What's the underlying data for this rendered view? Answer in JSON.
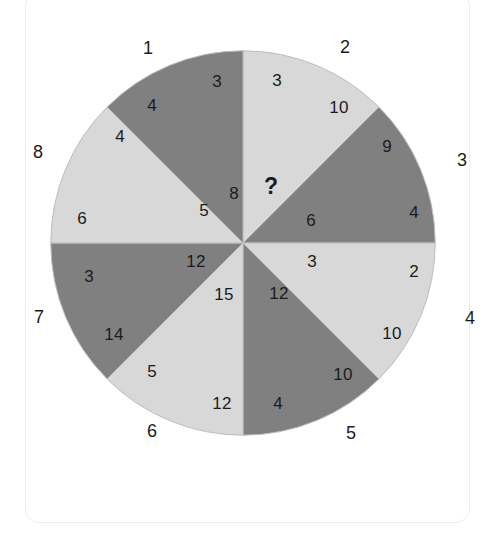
{
  "puzzle": {
    "center_cell": "?",
    "colors": {
      "light_sector": "#d8d8d8",
      "dark_sector": "#808080",
      "sector_outline": "#bdbdbd",
      "text": "#1b1b1b",
      "card_background": "#ffffff",
      "card_border": "#ececec"
    },
    "outer_labels": [
      {
        "name": "outer-label-1",
        "text": "1",
        "x": 148,
        "y": 48
      },
      {
        "name": "outer-label-2",
        "text": "2",
        "x": 345,
        "y": 47
      },
      {
        "name": "outer-label-3",
        "text": "3",
        "x": 462,
        "y": 160
      },
      {
        "name": "outer-label-4",
        "text": "4",
        "x": 470,
        "y": 318
      },
      {
        "name": "outer-label-5",
        "text": "5",
        "x": 351,
        "y": 433
      },
      {
        "name": "outer-label-6",
        "text": "6",
        "x": 152,
        "y": 431
      },
      {
        "name": "outer-label-7",
        "text": "7",
        "x": 39,
        "y": 317
      },
      {
        "name": "outer-label-8",
        "text": "8",
        "x": 38,
        "y": 152
      }
    ],
    "sectors": [
      {
        "name": "sector-1-top-left",
        "outer_label": "1",
        "fill": "light",
        "start_angle": -90,
        "end_angle": -45,
        "numbers": [
          {
            "name": "sector-1-number-outer",
            "text": "3",
            "x": 217,
            "y": 81
          },
          {
            "name": "sector-1-number-mid",
            "text": "4",
            "x": 152,
            "y": 105
          },
          {
            "name": "sector-1-number-inner",
            "text": "8",
            "x": 234,
            "y": 193
          }
        ]
      },
      {
        "name": "sector-2-top-right",
        "outer_label": "2",
        "fill": "dark",
        "start_angle": -90,
        "end_angle": -45,
        "numbers": [
          {
            "name": "sector-2-number-outer",
            "text": "3",
            "x": 277,
            "y": 80
          },
          {
            "name": "sector-2-number-mid",
            "text": "10",
            "x": 339,
            "y": 107
          },
          {
            "name": "sector-2-number-inner",
            "text": "?",
            "x": 271,
            "y": 186
          }
        ]
      },
      {
        "name": "sector-3-right-upper",
        "outer_label": "3",
        "fill": "light",
        "start_angle": -45,
        "end_angle": 0,
        "numbers": [
          {
            "name": "sector-3-number-outer",
            "text": "9",
            "x": 387,
            "y": 146
          },
          {
            "name": "sector-3-number-mid",
            "text": "4",
            "x": 414,
            "y": 212
          },
          {
            "name": "sector-3-number-inner",
            "text": "6",
            "x": 311,
            "y": 220
          }
        ]
      },
      {
        "name": "sector-4-right-lower",
        "outer_label": "4",
        "fill": "dark",
        "start_angle": 0,
        "end_angle": 45,
        "numbers": [
          {
            "name": "sector-4-number-outer",
            "text": "2",
            "x": 414,
            "y": 271
          },
          {
            "name": "sector-4-number-mid",
            "text": "10",
            "x": 392,
            "y": 333
          },
          {
            "name": "sector-4-number-inner",
            "text": "3",
            "x": 312,
            "y": 261
          }
        ]
      },
      {
        "name": "sector-5-bottom-right",
        "outer_label": "5",
        "fill": "light",
        "start_angle": 45,
        "end_angle": 90,
        "numbers": [
          {
            "name": "sector-5-number-outer",
            "text": "10",
            "x": 343,
            "y": 374
          },
          {
            "name": "sector-5-number-mid",
            "text": "4",
            "x": 278,
            "y": 403
          },
          {
            "name": "sector-5-number-inner",
            "text": "12",
            "x": 279,
            "y": 293
          }
        ]
      },
      {
        "name": "sector-6-bottom-left",
        "outer_label": "6",
        "fill": "dark",
        "start_angle": 90,
        "end_angle": 135,
        "numbers": [
          {
            "name": "sector-6-number-outer",
            "text": "12",
            "x": 222,
            "y": 403
          },
          {
            "name": "sector-6-number-mid",
            "text": "5",
            "x": 152,
            "y": 371
          },
          {
            "name": "sector-6-number-inner",
            "text": "15",
            "x": 224,
            "y": 294
          }
        ]
      },
      {
        "name": "sector-7-left-lower",
        "outer_label": "7",
        "fill": "light",
        "start_angle": 135,
        "end_angle": 180,
        "numbers": [
          {
            "name": "sector-7-number-outer",
            "text": "14",
            "x": 114,
            "y": 334
          },
          {
            "name": "sector-7-number-mid",
            "text": "3",
            "x": 89,
            "y": 276
          },
          {
            "name": "sector-7-number-inner",
            "text": "12",
            "x": 196,
            "y": 261
          }
        ]
      },
      {
        "name": "sector-8-left-upper",
        "outer_label": "8",
        "fill": "dark",
        "start_angle": 180,
        "end_angle": 225,
        "numbers": [
          {
            "name": "sector-8-number-outer",
            "text": "6",
            "x": 82,
            "y": 218
          },
          {
            "name": "sector-8-number-mid",
            "text": "4",
            "x": 120,
            "y": 136
          },
          {
            "name": "sector-8-number-inner",
            "text": "5",
            "x": 204,
            "y": 210
          }
        ]
      }
    ]
  }
}
